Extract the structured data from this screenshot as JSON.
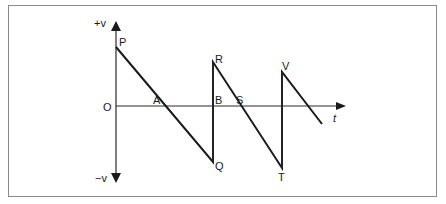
{
  "diagram": {
    "type": "sawtooth velocity-time graph",
    "axes": {
      "y_top_label": "+v",
      "y_bottom_label": "−v",
      "origin_label": "O",
      "x_label": "t"
    },
    "points": {
      "P": "P",
      "A": "A",
      "Q": "Q",
      "B": "B",
      "R": "R",
      "S": "S",
      "T": "T",
      "V": "V"
    },
    "colors": {
      "line": "#1a1a1a",
      "axis": "#2a2a2a",
      "frame": "#8a8a8a"
    }
  }
}
